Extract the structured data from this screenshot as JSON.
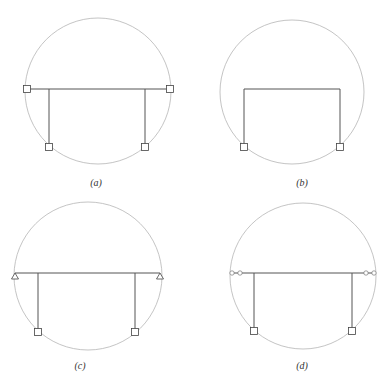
{
  "panels": [
    {
      "id": "a",
      "label": "(a)",
      "support": "square"
    },
    {
      "id": "b",
      "label": "(b)",
      "support": "none"
    },
    {
      "id": "c",
      "label": "(c)",
      "support": "triangle"
    },
    {
      "id": "d",
      "label": "(d)",
      "support": "hinge-circles"
    }
  ],
  "colors": {
    "circle": "#b5b5b5",
    "frame": "#555555",
    "node": "#444444"
  }
}
